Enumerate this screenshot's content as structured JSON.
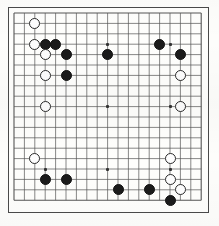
{
  "board": {
    "name": "go-board",
    "size": 19,
    "columns": 19,
    "rows": 19,
    "line_color": "#555555",
    "border_color": "#4a4a4a",
    "background_color": "#fefefc",
    "black_stone_color": "#1b1b1b",
    "white_stone_color": "#fdfdfd",
    "white_stone_outline": "#2b2b2b",
    "hoshi_color": "#333333",
    "origin_x": 14,
    "origin_y": 13,
    "spacing": 10.4,
    "stone_diameter": 11,
    "hoshi_points": [
      {
        "col": 3,
        "row": 3
      },
      {
        "col": 9,
        "row": 3
      },
      {
        "col": 15,
        "row": 3
      },
      {
        "col": 3,
        "row": 9
      },
      {
        "col": 9,
        "row": 9
      },
      {
        "col": 15,
        "row": 9
      },
      {
        "col": 3,
        "row": 15
      },
      {
        "col": 9,
        "row": 15
      },
      {
        "col": 15,
        "row": 15
      }
    ],
    "stones": [
      {
        "color": "white",
        "col": 2,
        "row": 1
      },
      {
        "color": "white",
        "col": 2,
        "row": 3
      },
      {
        "color": "black",
        "col": 3,
        "row": 3
      },
      {
        "color": "black",
        "col": 4,
        "row": 3
      },
      {
        "color": "white",
        "col": 3,
        "row": 4
      },
      {
        "color": "black",
        "col": 5,
        "row": 4
      },
      {
        "color": "white",
        "col": 3,
        "row": 6
      },
      {
        "color": "black",
        "col": 5,
        "row": 6
      },
      {
        "color": "black",
        "col": 9,
        "row": 4
      },
      {
        "color": "black",
        "col": 14,
        "row": 3
      },
      {
        "color": "black",
        "col": 16,
        "row": 4
      },
      {
        "color": "white",
        "col": 16,
        "row": 6
      },
      {
        "color": "white",
        "col": 16,
        "row": 9
      },
      {
        "color": "white",
        "col": 3,
        "row": 9
      },
      {
        "color": "white",
        "col": 2,
        "row": 14
      },
      {
        "color": "white",
        "col": 15,
        "row": 14
      },
      {
        "color": "black",
        "col": 3,
        "row": 16
      },
      {
        "color": "black",
        "col": 5,
        "row": 16
      },
      {
        "color": "white",
        "col": 15,
        "row": 16
      },
      {
        "color": "black",
        "col": 10,
        "row": 17
      },
      {
        "color": "black",
        "col": 13,
        "row": 17
      },
      {
        "color": "white",
        "col": 16,
        "row": 17
      },
      {
        "color": "black",
        "col": 15,
        "row": 18
      }
    ],
    "black_stone_count": 13,
    "white_stone_count": 10
  }
}
